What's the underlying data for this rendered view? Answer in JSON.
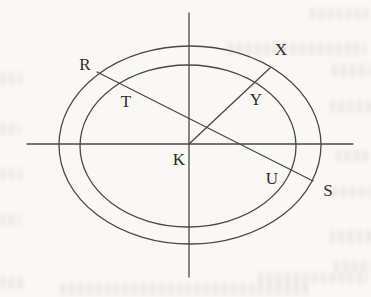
{
  "figure": {
    "type": "geometry-diagram",
    "shapes": {
      "outer_ellipse": "outer ellipse",
      "inner_ellipse": "inner ellipse",
      "horizontal_axis": "horizontal axis through K",
      "vertical_axis": "vertical axis through K",
      "chord": "chord R S crossing inner ellipse at T and U",
      "ray": "ray from K to X crossing inner ellipse at Y"
    },
    "points": [
      {
        "label": "R",
        "position": "on outer ellipse, upper left"
      },
      {
        "label": "X",
        "position": "on outer ellipse, upper right"
      },
      {
        "label": "T",
        "position": "on inner ellipse, upper left"
      },
      {
        "label": "Y",
        "position": "on inner ellipse, upper right"
      },
      {
        "label": "K",
        "position": "center of ellipses"
      },
      {
        "label": "U",
        "position": "on inner ellipse, lower right"
      },
      {
        "label": "S",
        "position": "on outer ellipse, lower right"
      }
    ],
    "colors": {
      "line": "#4a4844",
      "label_text": "#2e2c29",
      "paper": "#f9f8f5"
    }
  }
}
